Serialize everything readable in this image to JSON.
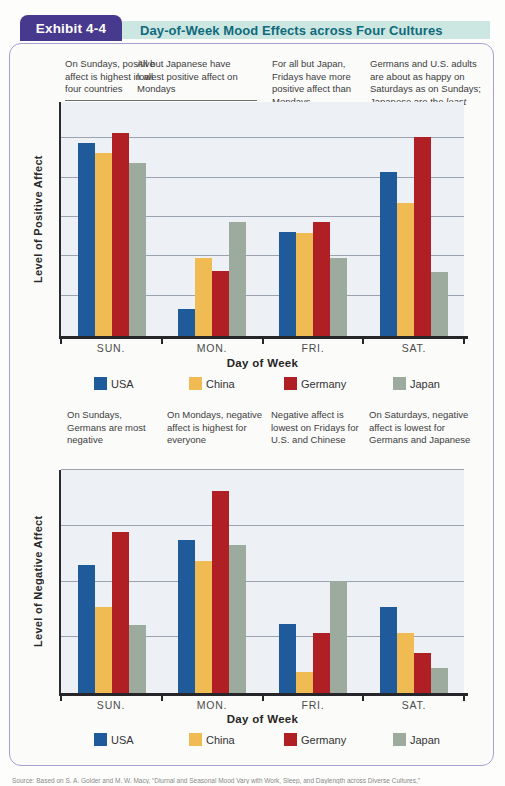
{
  "header": {
    "exhibit_label": "Exhibit 4-4",
    "title": "Day-of-Week Mood Effects across Four Cultures"
  },
  "colors": {
    "usa": "#1f5b9b",
    "china": "#efbb52",
    "germany": "#b01f24",
    "japan": "#9dab9f",
    "tab_bg": "#47398e",
    "tab_text": "#ffffff",
    "titlebar_bg": "#cce6e2",
    "titlebar_text": "#106b7c",
    "card_border": "#a7a0d0",
    "plot_bg": "#edf1f5",
    "axis": "#2b2b2e",
    "gridline": "#9aa3ae",
    "annotation_text": "#3d3d3d"
  },
  "chart_data": [
    {
      "type": "bar",
      "id": "positive-affect",
      "ylabel": "Level of Positive Affect",
      "xlabel": "Day of Week",
      "categories": [
        "SUN.",
        "MON.",
        "FRI.",
        "SAT."
      ],
      "series": [
        {
          "name": "USA",
          "color_key": "usa",
          "values": [
            82.5,
            11.5,
            44.4,
            70.1
          ]
        },
        {
          "name": "China",
          "color_key": "china",
          "values": [
            78.2,
            33.3,
            44.0,
            56.8
          ]
        },
        {
          "name": "Germany",
          "color_key": "germany",
          "values": [
            86.8,
            27.8,
            48.7,
            85.0
          ]
        },
        {
          "name": "Japan",
          "color_key": "japan",
          "values": [
            73.9,
            48.7,
            33.3,
            27.4
          ]
        }
      ],
      "ylim": [
        0,
        100
      ],
      "y_units": "relative level (axis has no numeric tick labels; values are % of plot height)",
      "gridlines_pct": [
        17,
        34,
        51,
        67.5,
        84.5
      ],
      "legend_position": "below",
      "annotations": [
        "On Sundays, positive affect is highest in all four countries",
        "All but Japanese have lowest positive affect on Mondays",
        "For all but Japan, Fridays have more positive affect than Mondays",
        "Germans and U.S. adults are about as happy on Saturdays as on Sundays; Japanese are the least happy"
      ],
      "annotation4_pre": "Germans and U.S. adults are about as happy on Saturdays as on Sundays; Japanese are the ",
      "annotation4_italic": "least",
      "annotation4_post": " happy"
    },
    {
      "type": "bar",
      "id": "negative-affect",
      "ylabel": "Level of Negative Affect",
      "xlabel": "Day of Week",
      "categories": [
        "SUN.",
        "MON.",
        "FRI.",
        "SAT."
      ],
      "series": [
        {
          "name": "USA",
          "color_key": "usa",
          "values": [
            57.4,
            68.6,
            30.9,
            38.6
          ]
        },
        {
          "name": "China",
          "color_key": "china",
          "values": [
            38.6,
            59.2,
            9.4,
            26.9
          ]
        },
        {
          "name": "Germany",
          "color_key": "germany",
          "values": [
            72.2,
            90.6,
            26.9,
            17.9
          ]
        },
        {
          "name": "Japan",
          "color_key": "japan",
          "values": [
            30.5,
            66.4,
            50.2,
            11.2
          ]
        }
      ],
      "ylim": [
        0,
        100
      ],
      "y_units": "relative level (axis has no numeric tick labels; values are % of plot height)",
      "gridlines_pct": [
        25,
        50,
        75,
        100
      ],
      "legend_position": "below",
      "annotations": [
        "On Sundays, Germans are most negative",
        "On Mondays, negative affect is highest for everyone",
        "Negative affect is lowest on Fridays for U.S. and Chinese",
        "On Saturdays, negative affect is lowest for Germans and Japanese"
      ]
    }
  ],
  "source": "Source: Based on S. A. Golder and M. W. Macy, “Diurnal and Seasonal Mood Vary with Work, Sleep, and Daylength across Diverse Cultures,”"
}
